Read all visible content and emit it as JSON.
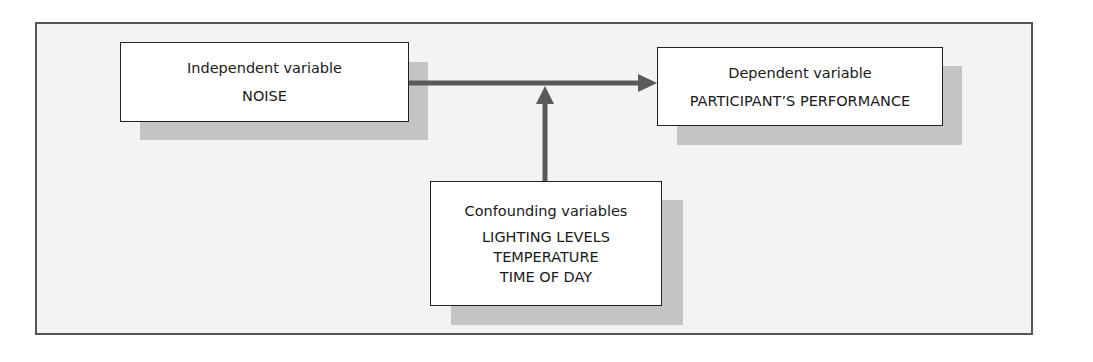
{
  "diagram": {
    "independent": {
      "title": "Independent variable",
      "value": "NOISE"
    },
    "dependent": {
      "title": "Dependent variable",
      "value": "PARTICIPANT’S PERFORMANCE"
    },
    "confounding": {
      "title": "Confounding variables",
      "items": [
        "LIGHTING LEVELS",
        "TEMPERATURE",
        "TIME OF DAY"
      ]
    },
    "arrows": [
      {
        "from": "independent",
        "to": "dependent",
        "direction": "right"
      },
      {
        "from": "confounding",
        "to": "independent-dependent-link",
        "direction": "up"
      }
    ],
    "colors": {
      "frame_border": "#555555",
      "frame_background": "#f3f3f3",
      "shadow": "#c4c4c4",
      "arrow": "#5a5a5a",
      "box_border": "#222222",
      "box_background": "#ffffff"
    }
  }
}
